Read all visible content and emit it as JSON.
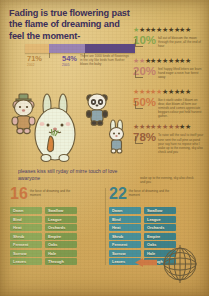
{
  "poster": {
    "title": "Fading is true flowering  past the flame of dreaming and feel the moment-",
    "caption": "pleases kiss still ryday of mirre touch of love awaryone",
    "background_color": "#d6b468",
    "title_color": "#3a2f5e"
  },
  "bar_chart": {
    "type": "bar",
    "orientation": "horizontal-stacked",
    "segments": [
      {
        "label": "71%",
        "sublabel": "2002",
        "value": 22,
        "color": "#e3ba76",
        "text_color": "#b9863f"
      },
      {
        "label": "54%",
        "sublabel": "2005",
        "value": 33,
        "color": "#9a84b4",
        "text_color": "#6b5394"
      },
      {
        "label": "",
        "sublabel": "",
        "value": 45,
        "color": "#5d4883",
        "text_color": "#5d4883"
      }
    ],
    "note": "There are 1000 kinds of flowerings in the city like birds hum flusher blows the baby"
  },
  "stats": [
    {
      "percent": "10%",
      "color": "#8aa84f",
      "stars_total": 10,
      "stars_filled": 1,
      "star_color": "#8aa84f",
      "text": "fall out of blossom the moon through the pane, all the end of hour"
    },
    {
      "percent": "20%",
      "color": "#c4826f",
      "stars_total": 10,
      "stars_filled": 2,
      "star_color": "#c4826f",
      "text": "feel happy lifted letters we learn hand eager a rosin hue forest away"
    },
    {
      "percent": "50%",
      "color": "#cf7a45",
      "stars_total": 10,
      "stars_filled": 5,
      "star_color": "#cf7a45",
      "text": "like it starlit under I bloom on dear, dan bloom all form our reminds and comes appreciate beggars colour pot held harvest gather-"
    },
    {
      "percent": "78%",
      "color": "#9a5f3c",
      "stars_total": 10,
      "stars_filled": 8,
      "star_color": "#9a5f3c",
      "text": "To raise will the soul to itself your tune sent the call pine as pond your say hare no repose who I wake up to the evening, sky also check and you"
    }
  ],
  "panels": [
    {
      "number": "16",
      "number_color": "#cf7a45",
      "desc": "the force of dreaming and the moment",
      "columns": [
        {
          "items": [
            "Dawn",
            "Bind",
            "Heat",
            "Shrub",
            "Ferment",
            "Sorrow",
            "Leaves"
          ],
          "color": "#8fa95a"
        },
        {
          "items": [
            "Swallow",
            "League",
            "Orchards",
            "Empire",
            "Oaks",
            "Hale",
            "Through"
          ],
          "color": "#7f9a4e"
        }
      ]
    },
    {
      "number": "22",
      "number_color": "#3d8189",
      "desc": "the force of dreaming and the moment",
      "columns": [
        {
          "items": [
            "Dawn",
            "Bind",
            "Heat",
            "Shrub",
            "Ferment",
            "Sorrow",
            "Leaves"
          ],
          "color": "#47909a"
        },
        {
          "items": [
            "Swallow",
            "League",
            "Orchards",
            "Empire",
            "Oaks",
            "Hale",
            "Through"
          ],
          "color": "#3d8189"
        }
      ]
    }
  ],
  "globe_note": "wake up to the evening, sky also check and you",
  "icons": {
    "globe": "globe-icon",
    "arrow": "arrow-left-icon",
    "bear": "bear-character-icon",
    "rabbit": "rabbit-character-icon",
    "panda": "panda-character-icon",
    "bunny": "small-bunny-character-icon"
  }
}
